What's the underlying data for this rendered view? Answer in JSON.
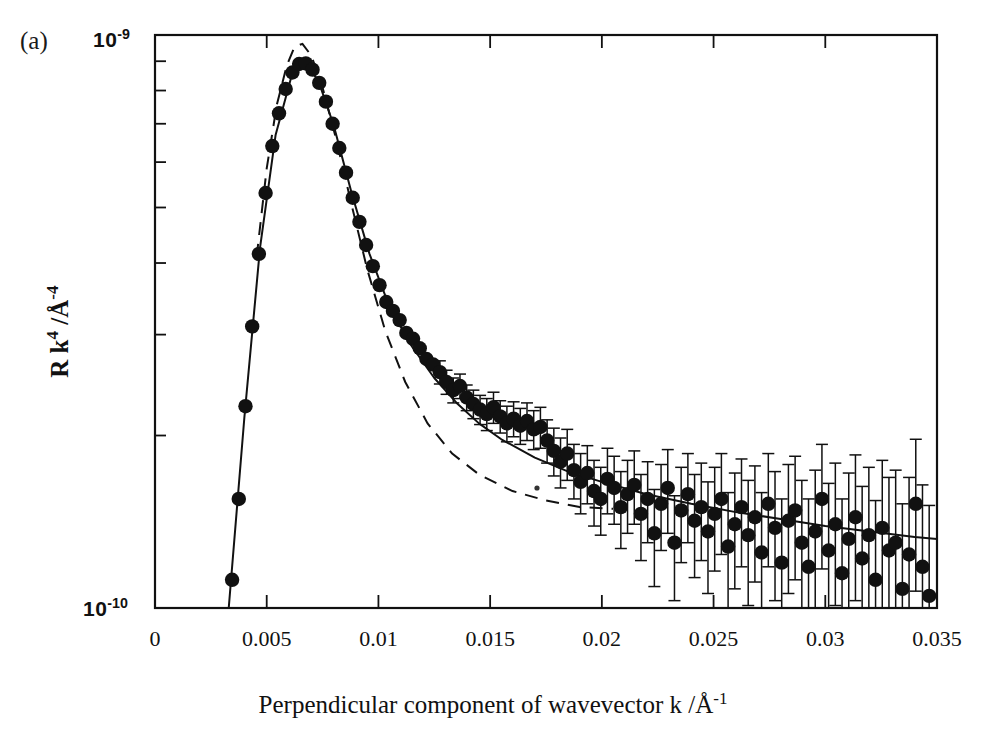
{
  "figure": {
    "panel_label": "(a)",
    "y_axis_title_parts": {
      "main": "R k",
      "exp1": "4",
      "slash_unit": " /Å",
      "exp2": "-4"
    },
    "y_axis_title_plain": "R k4 /Å-4",
    "x_axis_title": "Perpendicular component of wavevector k /Å-1",
    "x_axis_title_parts": {
      "main": "Perpendicular component of wavevector k /Å",
      "exp": "-1"
    },
    "y_top_mantissa": "10",
    "y_top_exponent": "-9",
    "y_bottom_mantissa": "10",
    "y_bottom_exponent": "-10",
    "ink_color": "#111111",
    "background_color": "#ffffff"
  },
  "chart_data": {
    "type": "scatter",
    "title": "",
    "subtitle": "",
    "panel": "(a)",
    "xlabel": "Perpendicular component of wavevector k /Å-1",
    "ylabel": "R k4 /Å-4",
    "xscale": "linear",
    "yscale": "log",
    "xlim": [
      0,
      0.035
    ],
    "ylim": [
      1e-10,
      1e-09
    ],
    "grid": false,
    "legend": "none",
    "xticks": [
      0,
      0.005,
      0.01,
      0.015,
      0.02,
      0.025,
      0.03,
      0.035
    ],
    "xtick_labels": [
      "0",
      "0.005",
      "0.01",
      "0.015",
      "0.02",
      "0.025",
      "0.03",
      "0.035"
    ],
    "yticks": [
      1e-10,
      1e-09
    ],
    "ytick_labels": [
      "10-10",
      "10-9"
    ],
    "series": [
      {
        "name": "measured reflectivity",
        "type": "scatter",
        "marker": "filled-circle",
        "color": "#111111",
        "errorbars": "vertical",
        "points": [
          {
            "x": 0.00345,
            "y": 1.12e-10,
            "err": 0
          },
          {
            "x": 0.00375,
            "y": 1.55e-10,
            "err": 0
          },
          {
            "x": 0.00405,
            "y": 2.25e-10,
            "err": 0
          },
          {
            "x": 0.00435,
            "y": 3.1e-10,
            "err": 0
          },
          {
            "x": 0.00465,
            "y": 4.15e-10,
            "err": 0
          },
          {
            "x": 0.00495,
            "y": 5.3e-10,
            "err": 0
          },
          {
            "x": 0.00525,
            "y": 6.4e-10,
            "err": 0
          },
          {
            "x": 0.00555,
            "y": 7.3e-10,
            "err": 0
          },
          {
            "x": 0.00585,
            "y": 8.05e-10,
            "err": 0
          },
          {
            "x": 0.00615,
            "y": 8.6e-10,
            "err": 0
          },
          {
            "x": 0.00645,
            "y": 8.9e-10,
            "err": 0
          },
          {
            "x": 0.00675,
            "y": 8.92e-10,
            "err": 0
          },
          {
            "x": 0.00705,
            "y": 8.7e-10,
            "err": 0
          },
          {
            "x": 0.00735,
            "y": 8.25e-10,
            "err": 0
          },
          {
            "x": 0.00765,
            "y": 7.65e-10,
            "err": 0
          },
          {
            "x": 0.00795,
            "y": 7e-10,
            "err": 0
          },
          {
            "x": 0.00825,
            "y": 6.35e-10,
            "err": 0
          },
          {
            "x": 0.00855,
            "y": 5.75e-10,
            "err": 0
          },
          {
            "x": 0.00885,
            "y": 5.2e-10,
            "err": 0
          },
          {
            "x": 0.00915,
            "y": 4.72e-10,
            "err": 0
          },
          {
            "x": 0.00945,
            "y": 4.3e-10,
            "err": 0
          },
          {
            "x": 0.00975,
            "y": 3.95e-10,
            "err": 0
          },
          {
            "x": 0.01005,
            "y": 3.66e-10,
            "err": 0
          },
          {
            "x": 0.01035,
            "y": 3.42e-10,
            "err": 0
          },
          {
            "x": 0.01065,
            "y": 3.3e-10,
            "err": 0
          },
          {
            "x": 0.01095,
            "y": 3.18e-10,
            "err": 0
          },
          {
            "x": 0.01125,
            "y": 3.02e-10,
            "err": 0
          },
          {
            "x": 0.01155,
            "y": 2.95e-10,
            "err": 0
          },
          {
            "x": 0.01185,
            "y": 2.84e-10,
            "err": 0
          },
          {
            "x": 0.01215,
            "y": 2.72e-10,
            "err": 0
          },
          {
            "x": 0.01245,
            "y": 2.66e-10,
            "err": 0
          },
          {
            "x": 0.01275,
            "y": 2.58e-10,
            "err": 1.2e-11
          },
          {
            "x": 0.01305,
            "y": 2.48e-10,
            "err": 1.2e-11
          },
          {
            "x": 0.01335,
            "y": 2.4e-10,
            "err": 1.2e-11
          },
          {
            "x": 0.01365,
            "y": 2.44e-10,
            "err": 1.2e-11
          },
          {
            "x": 0.01395,
            "y": 2.33e-10,
            "err": 1.2e-11
          },
          {
            "x": 0.01425,
            "y": 2.27e-10,
            "err": 1.3e-11
          },
          {
            "x": 0.01455,
            "y": 2.22e-10,
            "err": 1.3e-11
          },
          {
            "x": 0.01485,
            "y": 2.18e-10,
            "err": 1.4e-11
          },
          {
            "x": 0.01515,
            "y": 2.24e-10,
            "err": 1.4e-11
          },
          {
            "x": 0.01545,
            "y": 2.16e-10,
            "err": 1.4e-11
          },
          {
            "x": 0.01575,
            "y": 2.1e-10,
            "err": 1.5e-11
          },
          {
            "x": 0.01605,
            "y": 2.14e-10,
            "err": 1.5e-11
          },
          {
            "x": 0.01635,
            "y": 2.08e-10,
            "err": 1.5e-11
          },
          {
            "x": 0.01665,
            "y": 2.12e-10,
            "err": 1.6e-11
          },
          {
            "x": 0.01695,
            "y": 2.05e-10,
            "err": 1.6e-11
          },
          {
            "x": 0.01725,
            "y": 2.07e-10,
            "err": 1.7e-11
          },
          {
            "x": 0.01755,
            "y": 1.96e-10,
            "err": 1.7e-11
          },
          {
            "x": 0.01785,
            "y": 1.88e-10,
            "err": 1.8e-11
          },
          {
            "x": 0.01815,
            "y": 1.8e-10,
            "err": 1.8e-11
          },
          {
            "x": 0.01845,
            "y": 1.86e-10,
            "err": 1.9e-11
          },
          {
            "x": 0.01875,
            "y": 1.74e-10,
            "err": 1.9e-11
          },
          {
            "x": 0.01905,
            "y": 1.66e-10,
            "err": 2e-11
          },
          {
            "x": 0.01935,
            "y": 1.72e-10,
            "err": 2e-11
          },
          {
            "x": 0.01965,
            "y": 1.6e-10,
            "err": 2.1e-11
          },
          {
            "x": 0.01995,
            "y": 1.55e-10,
            "err": 2.1e-11
          },
          {
            "x": 0.02025,
            "y": 1.68e-10,
            "err": 2.2e-11
          },
          {
            "x": 0.02055,
            "y": 1.62e-10,
            "err": 2.2e-11
          },
          {
            "x": 0.02085,
            "y": 1.5e-10,
            "err": 2.3e-11
          },
          {
            "x": 0.02115,
            "y": 1.58e-10,
            "err": 2.3e-11
          },
          {
            "x": 0.02145,
            "y": 1.64e-10,
            "err": 2.4e-11
          },
          {
            "x": 0.02175,
            "y": 1.46e-10,
            "err": 2.5e-11
          },
          {
            "x": 0.02205,
            "y": 1.55e-10,
            "err": 2.5e-11
          },
          {
            "x": 0.02235,
            "y": 1.35e-10,
            "err": 2.6e-11
          },
          {
            "x": 0.02265,
            "y": 1.52e-10,
            "err": 2.6e-11
          },
          {
            "x": 0.02295,
            "y": 1.62e-10,
            "err": 2.7e-11
          },
          {
            "x": 0.02325,
            "y": 1.3e-10,
            "err": 2.7e-11
          },
          {
            "x": 0.02355,
            "y": 1.48e-10,
            "err": 2.8e-11
          },
          {
            "x": 0.02385,
            "y": 1.58e-10,
            "err": 2.8e-11
          },
          {
            "x": 0.02415,
            "y": 1.42e-10,
            "err": 2.9e-11
          },
          {
            "x": 0.02445,
            "y": 1.5e-10,
            "err": 2.9e-11
          },
          {
            "x": 0.02475,
            "y": 1.36e-10,
            "err": 3e-11
          },
          {
            "x": 0.02505,
            "y": 1.46e-10,
            "err": 3e-11
          },
          {
            "x": 0.02535,
            "y": 1.55e-10,
            "err": 3.1e-11
          },
          {
            "x": 0.02565,
            "y": 1.28e-10,
            "err": 3.1e-11
          },
          {
            "x": 0.02595,
            "y": 1.4e-10,
            "err": 3.2e-11
          },
          {
            "x": 0.02625,
            "y": 1.5e-10,
            "err": 3.2e-11
          },
          {
            "x": 0.02655,
            "y": 1.34e-10,
            "err": 3.3e-11
          },
          {
            "x": 0.02685,
            "y": 1.44e-10,
            "err": 3.3e-11
          },
          {
            "x": 0.02715,
            "y": 1.25e-10,
            "err": 3.4e-11
          },
          {
            "x": 0.02745,
            "y": 1.52e-10,
            "err": 3.4e-11
          },
          {
            "x": 0.02775,
            "y": 1.38e-10,
            "err": 3.5e-11
          },
          {
            "x": 0.02805,
            "y": 1.2e-10,
            "err": 3.5e-11
          },
          {
            "x": 0.02835,
            "y": 1.42e-10,
            "err": 3.6e-11
          },
          {
            "x": 0.02865,
            "y": 1.48e-10,
            "err": 3.6e-11
          },
          {
            "x": 0.02895,
            "y": 1.3e-10,
            "err": 3.7e-11
          },
          {
            "x": 0.02925,
            "y": 1.18e-10,
            "err": 3.7e-11
          },
          {
            "x": 0.02955,
            "y": 1.36e-10,
            "err": 3.8e-11
          },
          {
            "x": 0.02985,
            "y": 1.55e-10,
            "err": 3.8e-11
          },
          {
            "x": 0.03015,
            "y": 1.26e-10,
            "err": 3.9e-11
          },
          {
            "x": 0.03045,
            "y": 1.4e-10,
            "err": 3.9e-11
          },
          {
            "x": 0.03075,
            "y": 1.15e-10,
            "err": 4e-11
          },
          {
            "x": 0.03105,
            "y": 1.32e-10,
            "err": 4e-11
          },
          {
            "x": 0.03135,
            "y": 1.44e-10,
            "err": 4.1e-11
          },
          {
            "x": 0.03165,
            "y": 1.22e-10,
            "err": 4.1e-11
          },
          {
            "x": 0.03195,
            "y": 1.34e-10,
            "err": 4.2e-11
          },
          {
            "x": 0.03225,
            "y": 1.12e-10,
            "err": 4.2e-11
          },
          {
            "x": 0.03255,
            "y": 1.38e-10,
            "err": 4.3e-11
          },
          {
            "x": 0.03285,
            "y": 1.26e-10,
            "err": 4.3e-11
          },
          {
            "x": 0.03315,
            "y": 1.3e-10,
            "err": 4.4e-11
          },
          {
            "x": 0.03345,
            "y": 1.08e-10,
            "err": 4.4e-11
          },
          {
            "x": 0.03375,
            "y": 1.24e-10,
            "err": 4.5e-11
          },
          {
            "x": 0.03405,
            "y": 1.52e-10,
            "err": 4.5e-11
          },
          {
            "x": 0.03435,
            "y": 1.18e-10,
            "err": 4.6e-11
          },
          {
            "x": 0.03465,
            "y": 1.05e-10,
            "err": 4.6e-11
          }
        ]
      },
      {
        "name": "model fit (solid)",
        "type": "line",
        "style": "solid",
        "color": "#111111",
        "points": [
          {
            "x": 0.0033,
            "y": 1e-10
          },
          {
            "x": 0.004,
            "y": 2.15e-10
          },
          {
            "x": 0.0047,
            "y": 4.25e-10
          },
          {
            "x": 0.0054,
            "y": 6.7e-10
          },
          {
            "x": 0.0061,
            "y": 8.45e-10
          },
          {
            "x": 0.0067,
            "y": 8.9e-10
          },
          {
            "x": 0.0073,
            "y": 8.35e-10
          },
          {
            "x": 0.008,
            "y": 6.95e-10
          },
          {
            "x": 0.0088,
            "y": 5.3e-10
          },
          {
            "x": 0.0096,
            "y": 4.15e-10
          },
          {
            "x": 0.0105,
            "y": 3.35e-10
          },
          {
            "x": 0.0115,
            "y": 2.86e-10
          },
          {
            "x": 0.0125,
            "y": 2.52e-10
          },
          {
            "x": 0.0135,
            "y": 2.28e-10
          },
          {
            "x": 0.0145,
            "y": 2.1e-10
          },
          {
            "x": 0.0155,
            "y": 1.97e-10
          },
          {
            "x": 0.017,
            "y": 1.83e-10
          },
          {
            "x": 0.0185,
            "y": 1.73e-10
          },
          {
            "x": 0.02,
            "y": 1.66e-10
          },
          {
            "x": 0.022,
            "y": 1.58e-10
          },
          {
            "x": 0.024,
            "y": 1.52e-10
          },
          {
            "x": 0.026,
            "y": 1.47e-10
          },
          {
            "x": 0.028,
            "y": 1.43e-10
          },
          {
            "x": 0.03,
            "y": 1.39e-10
          },
          {
            "x": 0.032,
            "y": 1.36e-10
          },
          {
            "x": 0.034,
            "y": 1.33e-10
          },
          {
            "x": 0.035,
            "y": 1.32e-10
          }
        ]
      },
      {
        "name": "model fit (dashed)",
        "type": "line",
        "style": "dashed",
        "color": "#111111",
        "points": [
          {
            "x": 0.00455,
            "y": 4.1e-10
          },
          {
            "x": 0.005,
            "y": 5.85e-10
          },
          {
            "x": 0.00545,
            "y": 7.55e-10
          },
          {
            "x": 0.0059,
            "y": 8.85e-10
          },
          {
            "x": 0.00625,
            "y": 9.55e-10
          },
          {
            "x": 0.0066,
            "y": 9.65e-10
          },
          {
            "x": 0.007,
            "y": 9.2e-10
          },
          {
            "x": 0.0075,
            "y": 8.1e-10
          },
          {
            "x": 0.0081,
            "y": 6.6e-10
          },
          {
            "x": 0.0088,
            "y": 5.05e-10
          },
          {
            "x": 0.0095,
            "y": 3.9e-10
          },
          {
            "x": 0.0103,
            "y": 3.05e-10
          },
          {
            "x": 0.0112,
            "y": 2.48e-10
          },
          {
            "x": 0.0122,
            "y": 2.1e-10
          },
          {
            "x": 0.0133,
            "y": 1.86e-10
          },
          {
            "x": 0.0145,
            "y": 1.71e-10
          },
          {
            "x": 0.016,
            "y": 1.6e-10
          },
          {
            "x": 0.0175,
            "y": 1.54e-10
          },
          {
            "x": 0.019,
            "y": 1.5e-10
          },
          {
            "x": 0.0205,
            "y": 1.49e-10
          }
        ]
      }
    ],
    "annotations": []
  }
}
